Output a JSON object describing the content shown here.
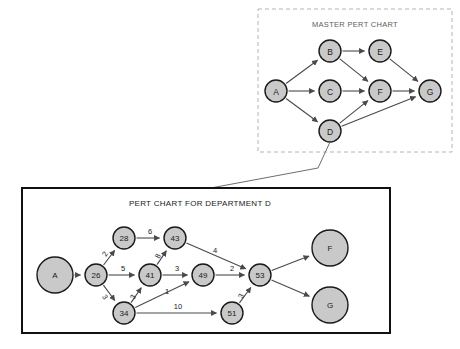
{
  "figure": {
    "background_color": "#ffffff",
    "node_fill": "#c9c9c9",
    "node_stroke": "#1a1a1a",
    "edge_color": "#4a4a4a",
    "footer_caption": ""
  },
  "master_panel": {
    "title": "MASTER PERT CHART",
    "border_style": "dashed",
    "border_color": "#b4b4b4",
    "box": {
      "x": 258,
      "y": 9,
      "w": 194,
      "h": 143
    },
    "title_pos": {
      "x": 355,
      "y": 24
    },
    "title_size": 7.5,
    "node_radius": 11,
    "node_font_size": 8.5,
    "nodes": [
      {
        "id": "A",
        "label": "A",
        "x": 276,
        "y": 91
      },
      {
        "id": "B",
        "label": "B",
        "x": 330,
        "y": 51
      },
      {
        "id": "C",
        "label": "C",
        "x": 330,
        "y": 91
      },
      {
        "id": "D",
        "label": "D",
        "x": 330,
        "y": 131
      },
      {
        "id": "E",
        "label": "E",
        "x": 380,
        "y": 51
      },
      {
        "id": "F",
        "label": "F",
        "x": 380,
        "y": 91
      },
      {
        "id": "G",
        "label": "G",
        "x": 430,
        "y": 91
      }
    ],
    "edges": [
      {
        "from": "A",
        "to": "B",
        "weight": ""
      },
      {
        "from": "A",
        "to": "C",
        "weight": ""
      },
      {
        "from": "A",
        "to": "D",
        "weight": ""
      },
      {
        "from": "B",
        "to": "E",
        "weight": ""
      },
      {
        "from": "B",
        "to": "F",
        "weight": ""
      },
      {
        "from": "C",
        "to": "F",
        "weight": ""
      },
      {
        "from": "D",
        "to": "F",
        "weight": ""
      },
      {
        "from": "D",
        "to": "G",
        "weight": ""
      },
      {
        "from": "E",
        "to": "G",
        "weight": ""
      },
      {
        "from": "F",
        "to": "G",
        "weight": ""
      }
    ]
  },
  "department_panel": {
    "title": "PERT CHART FOR DEPARTMENT D",
    "border_style": "solid",
    "border_color": "#111111",
    "box": {
      "x": 22,
      "y": 188,
      "w": 368,
      "h": 145
    },
    "title_pos": {
      "x": 200,
      "y": 203
    },
    "title_size": 8,
    "node_font_size": 8,
    "nodes": [
      {
        "id": "A",
        "label": "A",
        "x": 55,
        "y": 275,
        "r": 18
      },
      {
        "id": "26",
        "label": "26",
        "x": 96,
        "y": 275,
        "r": 11
      },
      {
        "id": "28",
        "label": "28",
        "x": 124,
        "y": 238,
        "r": 11
      },
      {
        "id": "43",
        "label": "43",
        "x": 175,
        "y": 238,
        "r": 11
      },
      {
        "id": "41",
        "label": "41",
        "x": 150,
        "y": 275,
        "r": 11
      },
      {
        "id": "34",
        "label": "34",
        "x": 124,
        "y": 313,
        "r": 11
      },
      {
        "id": "49",
        "label": "49",
        "x": 203,
        "y": 275,
        "r": 11
      },
      {
        "id": "51",
        "label": "51",
        "x": 232,
        "y": 313,
        "r": 11
      },
      {
        "id": "53",
        "label": "53",
        "x": 260,
        "y": 275,
        "r": 11
      },
      {
        "id": "F",
        "label": "F",
        "x": 330,
        "y": 248,
        "r": 18
      },
      {
        "id": "G",
        "label": "G",
        "x": 330,
        "y": 305,
        "r": 18
      }
    ],
    "edges": [
      {
        "from": "A",
        "to": "26",
        "weight": "",
        "wx": 0,
        "wy": 0,
        "rot": 0
      },
      {
        "from": "26",
        "to": "28",
        "weight": "2",
        "wx": 105,
        "wy": 254,
        "rot": -58
      },
      {
        "from": "26",
        "to": "41",
        "weight": "5",
        "wx": 123,
        "wy": 268,
        "rot": 0
      },
      {
        "from": "26",
        "to": "34",
        "weight": "3",
        "wx": 105,
        "wy": 297,
        "rot": 55
      },
      {
        "from": "28",
        "to": "43",
        "weight": "6",
        "wx": 150,
        "wy": 231,
        "rot": 0
      },
      {
        "from": "41",
        "to": "43",
        "weight": "8",
        "wx": 158,
        "wy": 256,
        "rot": -63
      },
      {
        "from": "41",
        "to": "49",
        "weight": "3",
        "wx": 177,
        "wy": 268,
        "rot": 0
      },
      {
        "from": "34",
        "to": "41",
        "weight": "3",
        "wx": 133,
        "wy": 297,
        "rot": -62
      },
      {
        "from": "34",
        "to": "49",
        "weight": "1",
        "wx": 167,
        "wy": 291,
        "rot": 0
      },
      {
        "from": "34",
        "to": "51",
        "weight": "10",
        "wx": 178,
        "wy": 306,
        "rot": 0
      },
      {
        "from": "43",
        "to": "53",
        "weight": "4",
        "wx": 215,
        "wy": 250,
        "rot": 0
      },
      {
        "from": "49",
        "to": "53",
        "weight": "2",
        "wx": 232,
        "wy": 268,
        "rot": 0
      },
      {
        "from": "51",
        "to": "53",
        "weight": "3",
        "wx": 241,
        "wy": 296,
        "rot": -62
      },
      {
        "from": "53",
        "to": "F",
        "weight": "",
        "wx": 0,
        "wy": 0,
        "rot": 0
      },
      {
        "from": "53",
        "to": "G",
        "weight": "",
        "wx": 0,
        "wy": 0,
        "rot": 0
      }
    ]
  },
  "connector": {
    "label": "",
    "from_node": "D",
    "to_panel": "department_panel",
    "points": "330,142 318,168 200,190"
  }
}
